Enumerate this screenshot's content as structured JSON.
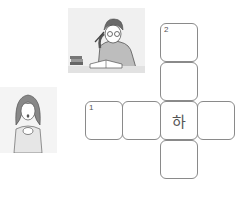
{
  "illustrations": [
    {
      "name": "man-studying-at-desk",
      "description": "Man with glasses holding pen, reading a book at a desk with stacked books"
    },
    {
      "name": "surprised-girl",
      "description": "Girl with long hair, hands clasped, mouth open in surprise"
    }
  ],
  "crossword": {
    "clues": [
      {
        "number": "1",
        "direction": "across"
      },
      {
        "number": "2",
        "direction": "down"
      }
    ],
    "cells": [
      {
        "id": "d1",
        "x": 160,
        "y": 23,
        "number": "2",
        "char": ""
      },
      {
        "id": "d2",
        "x": 160,
        "y": 62,
        "number": "",
        "char": ""
      },
      {
        "id": "a1",
        "x": 85,
        "y": 101,
        "number": "1",
        "char": ""
      },
      {
        "id": "a2",
        "x": 122,
        "y": 101,
        "number": "",
        "char": ""
      },
      {
        "id": "x",
        "x": 160,
        "y": 101,
        "number": "",
        "char": "하"
      },
      {
        "id": "a4",
        "x": 197,
        "y": 101,
        "number": "",
        "char": ""
      },
      {
        "id": "d4",
        "x": 160,
        "y": 140,
        "number": "",
        "char": ""
      }
    ]
  },
  "colors": {
    "border": "#8a8a8a",
    "text": "#555555",
    "illustration_bg": "#efefef"
  }
}
